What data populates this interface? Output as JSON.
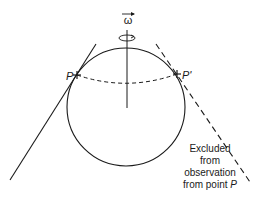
{
  "diagram": {
    "labels": {
      "omega": "ω",
      "point_p": "P",
      "point_p_prime": "P'",
      "note_line1": "Excluded",
      "note_line2": "from",
      "note_line3": "observation",
      "note_line4_prefix": "from point ",
      "note_line4_var": "P"
    },
    "colors": {
      "stroke": "#1a1a1a",
      "background": "#ffffff"
    }
  }
}
